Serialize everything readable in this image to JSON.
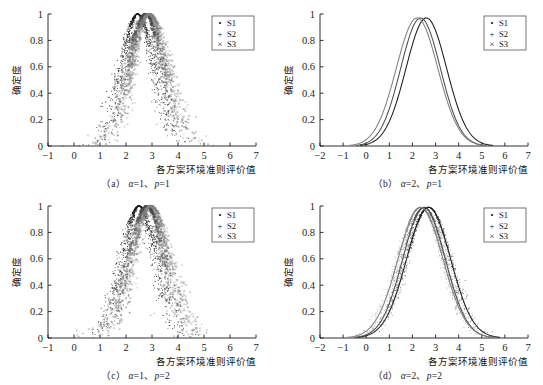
{
  "figure": {
    "background": "#ffffff",
    "ink": "#1a1a1a",
    "panel_count": 4
  },
  "legend": {
    "entries": [
      {
        "marker": "dot-marker-icon",
        "glyph": "•",
        "label": "S1",
        "color": "#1a1a1a"
      },
      {
        "marker": "plus-marker-icon",
        "glyph": "+",
        "label": "S2",
        "color": "#555555"
      },
      {
        "marker": "cross-marker-icon",
        "glyph": "×",
        "label": "S3",
        "color": "#888888"
      }
    ],
    "border_color": "#555555"
  },
  "axes_common": {
    "ylabel": "确定度",
    "xlabel": "各方案环境准则评价值",
    "yticks": [
      "0",
      "0.2",
      "0.4",
      "0.6",
      "0.8",
      "1"
    ],
    "ylim": [
      0,
      1
    ],
    "grid": false
  },
  "captions": {
    "a": {
      "index": "（a）",
      "alpha": "α",
      "alpha_val": "=1、",
      "p": "p",
      "p_val": "=1"
    },
    "b": {
      "index": "（b）",
      "alpha": "α",
      "alpha_val": "=2、",
      "p": "p",
      "p_val": "=1"
    },
    "c": {
      "index": "（c）",
      "alpha": "α",
      "alpha_val": "=1、",
      "p": "p",
      "p_val": "=2"
    },
    "d": {
      "index": "（d）",
      "alpha": "α",
      "alpha_val": "=2、",
      "p": "p",
      "p_val": "=2"
    }
  },
  "chart_data": [
    {
      "id": "panel-a",
      "type": "scatter",
      "title": "",
      "xlabel": "各方案环境准则评价值",
      "ylabel": "确定度",
      "xlim": [
        -1,
        7
      ],
      "ylim": [
        0,
        1
      ],
      "xticks": [
        -1,
        0,
        1,
        2,
        3,
        4,
        5,
        6,
        7
      ],
      "xticklabels": [
        "−1",
        "0",
        "1",
        "2",
        "3",
        "4",
        "5",
        "6",
        "7"
      ],
      "yticks": [
        0,
        0.2,
        0.4,
        0.6,
        0.8,
        1
      ],
      "yticklabels": [
        "0",
        "0.2",
        "0.4",
        "0.6",
        "0.8",
        "1"
      ],
      "legend_position": "upper right",
      "grid": false,
      "series": [
        {
          "name": "S1",
          "marker": "dot",
          "color": "#1a1a1a",
          "expectation": 2.45,
          "entropy": 0.62,
          "hyper_entropy": 0.11,
          "n_points": 900
        },
        {
          "name": "S2",
          "marker": "plus",
          "color": "#4d4d4d",
          "expectation": 2.75,
          "entropy": 0.66,
          "hyper_entropy": 0.12,
          "n_points": 900
        },
        {
          "name": "S3",
          "marker": "cross",
          "color": "#808080",
          "expectation": 2.9,
          "entropy": 0.7,
          "hyper_entropy": 0.13,
          "n_points": 900
        }
      ]
    },
    {
      "id": "panel-b",
      "type": "line",
      "title": "",
      "xlabel": "各方案环境准则评价值",
      "ylabel": "确定度",
      "xlim": [
        -2,
        7
      ],
      "ylim": [
        0,
        1
      ],
      "xticks": [
        -2,
        -1,
        0,
        1,
        2,
        3,
        4,
        5,
        6,
        7
      ],
      "xticklabels": [
        "−2",
        "−1",
        "0",
        "1",
        "2",
        "3",
        "4",
        "5",
        "6",
        "7"
      ],
      "yticks": [
        0,
        0.2,
        0.4,
        0.6,
        0.8,
        1
      ],
      "yticklabels": [
        "0",
        "0.2",
        "0.4",
        "0.6",
        "0.8",
        "1"
      ],
      "legend_position": "upper right",
      "grid": false,
      "series": [
        {
          "name": "S1",
          "color": "#1a1a1a",
          "expectation": 2.6,
          "entropy": 0.88,
          "peak": 0.97
        },
        {
          "name": "S2",
          "color": "#4d4d4d",
          "expectation": 2.35,
          "entropy": 0.86,
          "peak": 0.97
        },
        {
          "name": "S3",
          "color": "#808080",
          "expectation": 2.2,
          "entropy": 0.9,
          "peak": 0.97
        }
      ]
    },
    {
      "id": "panel-c",
      "type": "scatter",
      "title": "",
      "xlabel": "各方案环境准则评价值",
      "ylabel": "确定度",
      "xlim": [
        -1,
        7
      ],
      "ylim": [
        0,
        1
      ],
      "xticks": [
        -1,
        0,
        1,
        2,
        3,
        4,
        5,
        6,
        7
      ],
      "xticklabels": [
        "−1",
        "0",
        "1",
        "2",
        "3",
        "4",
        "5",
        "6",
        "7"
      ],
      "yticks": [
        0,
        0.2,
        0.4,
        0.6,
        0.8,
        1
      ],
      "yticklabels": [
        "0",
        "0.2",
        "0.4",
        "0.6",
        "0.8",
        "1"
      ],
      "legend_position": "upper right",
      "grid": false,
      "series": [
        {
          "name": "S1",
          "marker": "dot",
          "color": "#1a1a1a",
          "expectation": 2.5,
          "entropy": 0.64,
          "hyper_entropy": 0.12,
          "n_points": 900
        },
        {
          "name": "S2",
          "marker": "plus",
          "color": "#4d4d4d",
          "expectation": 2.8,
          "entropy": 0.68,
          "hyper_entropy": 0.13,
          "n_points": 900
        },
        {
          "name": "S3",
          "marker": "cross",
          "color": "#808080",
          "expectation": 2.95,
          "entropy": 0.72,
          "hyper_entropy": 0.14,
          "n_points": 900
        }
      ]
    },
    {
      "id": "panel-d",
      "type": "line",
      "title": "",
      "xlabel": "各方案环境准则评价值",
      "ylabel": "确定度",
      "xlim": [
        -2,
        7
      ],
      "ylim": [
        0,
        1
      ],
      "xticks": [
        -2,
        -1,
        0,
        1,
        2,
        3,
        4,
        5,
        6,
        7
      ],
      "xticklabels": [
        "−2",
        "−1",
        "0",
        "1",
        "2",
        "3",
        "4",
        "5",
        "6",
        "7"
      ],
      "yticks": [
        0,
        0.2,
        0.4,
        0.6,
        0.8,
        1
      ],
      "yticklabels": [
        "0",
        "0.2",
        "0.4",
        "0.6",
        "0.8",
        "1"
      ],
      "legend_position": "upper right",
      "grid": false,
      "series": [
        {
          "name": "S1",
          "color": "#1a1a1a",
          "expectation": 2.7,
          "entropy": 0.95,
          "peak": 0.99,
          "scatter": true
        },
        {
          "name": "S2",
          "color": "#4d4d4d",
          "expectation": 2.5,
          "entropy": 0.92,
          "peak": 0.99,
          "scatter": true
        },
        {
          "name": "S3",
          "color": "#808080",
          "expectation": 2.35,
          "entropy": 0.97,
          "peak": 0.99,
          "scatter": true
        }
      ]
    }
  ]
}
